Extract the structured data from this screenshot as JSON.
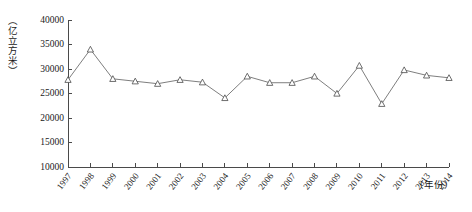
{
  "chart_data": {
    "type": "line",
    "title": "",
    "subtitle": "",
    "xlabel": "（年份）",
    "ylabel": "（亿立方米）",
    "x": [
      1997,
      1998,
      1999,
      2000,
      2001,
      2002,
      2003,
      2004,
      2005,
      2006,
      2007,
      2008,
      2009,
      2010,
      2011,
      2012,
      2013,
      2014
    ],
    "categories": [
      "1997",
      "1998",
      "1999",
      "2000",
      "2001",
      "2002",
      "2003",
      "2004",
      "2005",
      "2006",
      "2007",
      "2008",
      "2009",
      "2010",
      "2011",
      "2012",
      "2013",
      "2014"
    ],
    "values": [
      27800,
      34000,
      28000,
      27500,
      27000,
      27800,
      27300,
      24100,
      28500,
      27200,
      27200,
      28500,
      25000,
      30700,
      22900,
      29800,
      28700,
      28200
    ],
    "series": [
      {
        "name": "水资源总量",
        "values": [
          27800,
          34000,
          28000,
          27500,
          27000,
          27800,
          27300,
          24100,
          28500,
          27200,
          27200,
          28500,
          25000,
          30700,
          22900,
          29800,
          28700,
          28200
        ]
      }
    ],
    "ylim": [
      10000,
      40000
    ],
    "yticks": [
      10000,
      15000,
      20000,
      25000,
      30000,
      35000,
      40000
    ],
    "ytick_labels": [
      "10000",
      "15000",
      "20000",
      "25000",
      "30000",
      "35000",
      "40000"
    ],
    "xlim": [
      1997,
      2014
    ],
    "grid": false,
    "legend": false,
    "legend_position": "none",
    "marker": "triangle-open",
    "line_color": "#6f6f6f",
    "marker_color": "#4a4a4a",
    "axis_color": "#4a4a4a",
    "background_color": "#ffffff"
  }
}
